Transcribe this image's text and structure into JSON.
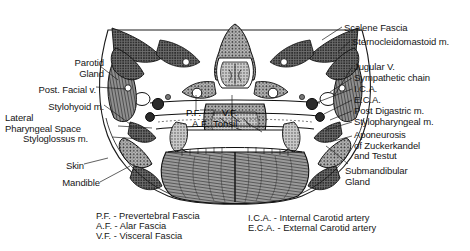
{
  "figure": {
    "type": "anatomical-cross-section",
    "background_color": "#ffffff",
    "ink_color": "#1a1a1a"
  },
  "labels_left": [
    {
      "id": "parotid-gland",
      "text": "Parotid\nGland",
      "x": 62,
      "y": 58,
      "align": "right"
    },
    {
      "id": "post-facial-vein",
      "text": "Post. Facial v.",
      "x": 55,
      "y": 85,
      "align": "right"
    },
    {
      "id": "stylohyoid-muscle",
      "text": "Stylohyoid m.",
      "x": 65,
      "y": 102,
      "align": "right"
    },
    {
      "id": "lateral-pharyngeal-space",
      "text": "Lateral\nPharyngeal Space",
      "x": 6,
      "y": 113,
      "align": "left"
    },
    {
      "id": "styloglossus-muscle",
      "text": "Styloglossus m.",
      "x": 23,
      "y": 134,
      "align": "left"
    },
    {
      "id": "skin",
      "text": "Skin",
      "x": 60,
      "y": 161,
      "align": "left"
    },
    {
      "id": "mandible",
      "text": "Mandible",
      "x": 55,
      "y": 178,
      "align": "left"
    }
  ],
  "labels_right": [
    {
      "id": "scalene-fascia",
      "text": "Scalene Fascia",
      "x": 344,
      "y": 23
    },
    {
      "id": "sternocleidomastoid-muscle",
      "text": "Sternocleidomastoid m.",
      "x": 352,
      "y": 37
    },
    {
      "id": "jugular-vein",
      "text": "Jugular V.",
      "x": 354,
      "y": 63
    },
    {
      "id": "sympathetic-chain",
      "text": "Sympathetic chain",
      "x": 354,
      "y": 74
    },
    {
      "id": "ica",
      "text": "I.C.A.",
      "x": 354,
      "y": 85
    },
    {
      "id": "eca",
      "text": "E.C.A.",
      "x": 354,
      "y": 96
    },
    {
      "id": "post-digastric-muscle",
      "text": "Post Digastric m.",
      "x": 354,
      "y": 107
    },
    {
      "id": "stylopharyngeal-muscle",
      "text": "Stylopharyngeal m.",
      "x": 354,
      "y": 118
    },
    {
      "id": "aponeurosis-zuckerkandel-testut",
      "text": "Aponeurosis\nof Zuckerkandel\nand Testut",
      "x": 354,
      "y": 132
    },
    {
      "id": "submandibular-gland",
      "text": "Submandibular\nGland",
      "x": 346,
      "y": 168
    }
  ],
  "labels_inner": [
    {
      "id": "prevertebral-fascia-abbrev",
      "text": "P.F.",
      "x": 188,
      "y": 112
    },
    {
      "id": "visceral-fascia-abbrev",
      "text": "V.F.",
      "x": 224,
      "y": 112
    },
    {
      "id": "alar-fascia-abbrev",
      "text": "A.F.",
      "x": 194,
      "y": 123
    },
    {
      "id": "tonsil",
      "text": "Tonsil",
      "x": 215,
      "y": 123
    }
  ],
  "legend_left": [
    {
      "id": "legend-pf",
      "text": "P.F. - Prevertebral Fascia"
    },
    {
      "id": "legend-af",
      "text": "A.F. - Alar Fascia"
    },
    {
      "id": "legend-vf",
      "text": "V.F. - Visceral Fascia"
    }
  ],
  "legend_right": [
    {
      "id": "legend-ica",
      "text": "I.C.A. - Internal Carotid artery"
    },
    {
      "id": "legend-eca",
      "text": "E.C.A. - External Carotid artery"
    }
  ],
  "legend_positions": {
    "left_x": 96,
    "left_y": 211,
    "right_x": 248,
    "right_y": 211
  }
}
